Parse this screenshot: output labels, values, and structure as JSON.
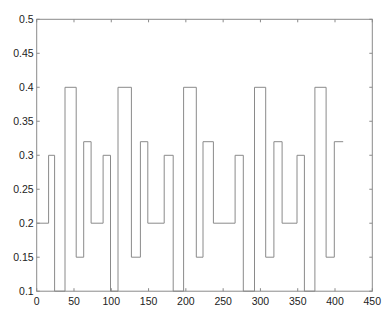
{
  "chart_data": {
    "type": "line",
    "subtype": "step",
    "title": "",
    "xlabel": "",
    "ylabel": "",
    "xlim": [
      0,
      450
    ],
    "ylim": [
      0.1,
      0.5
    ],
    "xticks": [
      0,
      50,
      100,
      150,
      200,
      250,
      300,
      350,
      400,
      450
    ],
    "yticks": [
      0.1,
      0.15,
      0.2,
      0.25,
      0.3,
      0.35,
      0.4,
      0.45,
      0.5
    ],
    "xtick_labels": [
      "0",
      "50",
      "100",
      "150",
      "200",
      "250",
      "300",
      "350",
      "400",
      "450"
    ],
    "ytick_labels": [
      "0.1",
      "0.15",
      "0.2",
      "0.25",
      "0.3",
      "0.35",
      "0.4",
      "0.45",
      "0.5"
    ],
    "grid": false,
    "legend": null,
    "line_color": "#8a8a8a",
    "series": [
      {
        "name": "signal",
        "steps": [
          {
            "x0": 0,
            "x1": 16,
            "y": 0.2
          },
          {
            "x0": 16,
            "x1": 24,
            "y": 0.3
          },
          {
            "x0": 24,
            "x1": 38,
            "y": 0.1
          },
          {
            "x0": 38,
            "x1": 53,
            "y": 0.4
          },
          {
            "x0": 53,
            "x1": 63,
            "y": 0.15
          },
          {
            "x0": 63,
            "x1": 73,
            "y": 0.32
          },
          {
            "x0": 73,
            "x1": 89,
            "y": 0.2
          },
          {
            "x0": 89,
            "x1": 99,
            "y": 0.3
          },
          {
            "x0": 99,
            "x1": 109,
            "y": 0.1
          },
          {
            "x0": 109,
            "x1": 127,
            "y": 0.4
          },
          {
            "x0": 127,
            "x1": 139,
            "y": 0.15
          },
          {
            "x0": 139,
            "x1": 149,
            "y": 0.32
          },
          {
            "x0": 149,
            "x1": 171,
            "y": 0.2
          },
          {
            "x0": 171,
            "x1": 183,
            "y": 0.3
          },
          {
            "x0": 183,
            "x1": 197,
            "y": 0.1
          },
          {
            "x0": 197,
            "x1": 214,
            "y": 0.4
          },
          {
            "x0": 214,
            "x1": 223,
            "y": 0.15
          },
          {
            "x0": 223,
            "x1": 237,
            "y": 0.32
          },
          {
            "x0": 237,
            "x1": 266,
            "y": 0.2
          },
          {
            "x0": 266,
            "x1": 277,
            "y": 0.3
          },
          {
            "x0": 277,
            "x1": 292,
            "y": 0.1
          },
          {
            "x0": 292,
            "x1": 307,
            "y": 0.4
          },
          {
            "x0": 307,
            "x1": 318,
            "y": 0.15
          },
          {
            "x0": 318,
            "x1": 329,
            "y": 0.32
          },
          {
            "x0": 329,
            "x1": 349,
            "y": 0.2
          },
          {
            "x0": 349,
            "x1": 359,
            "y": 0.3
          },
          {
            "x0": 359,
            "x1": 373,
            "y": 0.1
          },
          {
            "x0": 373,
            "x1": 388,
            "y": 0.4
          },
          {
            "x0": 388,
            "x1": 399,
            "y": 0.15
          },
          {
            "x0": 399,
            "x1": 411,
            "y": 0.32
          }
        ]
      }
    ]
  }
}
